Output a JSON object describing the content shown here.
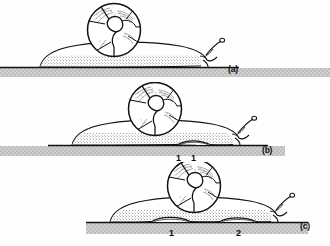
{
  "figure": {
    "type": "scientific-line-drawing",
    "background_color": "#ffffff",
    "ink_color": "#111111",
    "ground_color": "#c9c9c9",
    "ground_edge_color": "#1a1a1a"
  },
  "panels": [
    {
      "id": "a",
      "label": "(a)",
      "description": "Snail at rest on substrate, foot flat, no pedal wave",
      "wave_labels": []
    },
    {
      "id": "b",
      "label": "(b)",
      "description": "Snail with first pedal wave formed at rear of foot",
      "wave_labels": [
        "1"
      ]
    },
    {
      "id": "c",
      "label": "(c)",
      "description": "Snail with pedal wave 1 advanced forward and second wave 2 formed at rear",
      "wave_labels": [
        "1",
        "2"
      ]
    }
  ],
  "annotations": {
    "panel_b_wave_1": "1",
    "panel_c_wave_top": "1",
    "panel_c_wave_1": "1",
    "panel_c_wave_2": "2"
  }
}
